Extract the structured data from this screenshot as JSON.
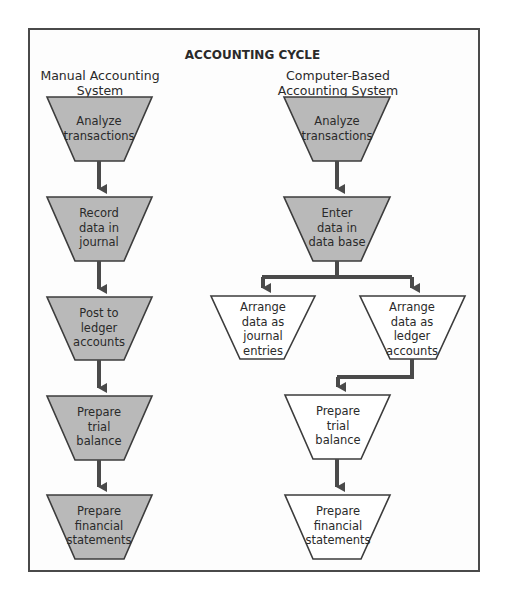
{
  "diagram": {
    "title": "ACCOUNTING CYCLE",
    "colors": {
      "line": "#4a4a4a",
      "shaded_fill": "#b9b9b9",
      "plain_fill": "#ffffff",
      "text": "#2a2a2a"
    },
    "columns": [
      {
        "heading_line1": "Manual Accounting",
        "heading_line2": "System",
        "steps": [
          {
            "lines": [
              "Analyze",
              "transactions"
            ],
            "shaded": true
          },
          {
            "lines": [
              "Record",
              "data in",
              "journal"
            ],
            "shaded": true
          },
          {
            "lines": [
              "Post to",
              "ledger",
              "accounts"
            ],
            "shaded": true
          },
          {
            "lines": [
              "Prepare",
              "trial",
              "balance"
            ],
            "shaded": true
          },
          {
            "lines": [
              "Prepare",
              "financial",
              "statements"
            ],
            "shaded": true
          }
        ]
      },
      {
        "heading_line1": "Computer-Based",
        "heading_line2": "Accounting System",
        "steps": [
          {
            "lines": [
              "Analyze",
              "transactions"
            ],
            "shaded": true
          },
          {
            "lines": [
              "Enter",
              "data in",
              "data base"
            ],
            "shaded": true
          },
          {
            "lines": [
              "Arrange",
              "data as",
              "journal",
              "entries"
            ],
            "shaded": false
          },
          {
            "lines": [
              "Arrange",
              "data as",
              "ledger",
              "accounts"
            ],
            "shaded": false
          },
          {
            "lines": [
              "Prepare",
              "trial",
              "balance"
            ],
            "shaded": false
          },
          {
            "lines": [
              "Prepare",
              "financial",
              "statements"
            ],
            "shaded": false
          }
        ]
      }
    ]
  }
}
